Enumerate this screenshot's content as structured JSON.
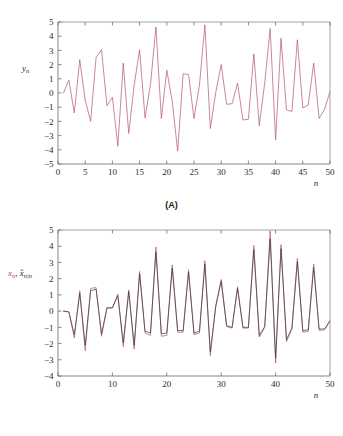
{
  "figure": {
    "background_color": "#ffffff",
    "panel_a_caption": "(A)",
    "panel_b_caption": "(B)"
  },
  "colors": {
    "measurement_red": "#b2556a",
    "estimate_black": "#3a3a3a",
    "label_red": "#c0395a",
    "axis": "#6b6b6b"
  },
  "chart_data": [
    {
      "type": "line",
      "panel": "(A)",
      "title": "",
      "xlabel": "n",
      "ylabel": "y_n",
      "ylabel_parts": {
        "base": "y",
        "sub": "n"
      },
      "xlim": [
        0,
        50
      ],
      "ylim": [
        -5,
        5
      ],
      "xticks": [
        0,
        5,
        10,
        15,
        20,
        25,
        30,
        35,
        40,
        45,
        50
      ],
      "xticklabels": [
        "0",
        "5",
        "10",
        "15",
        "20",
        "25",
        "30",
        "35",
        "40",
        "45",
        "50"
      ],
      "yticks": [
        -5,
        -4,
        -3,
        -2,
        -1,
        0,
        1,
        2,
        3,
        4,
        5
      ],
      "yticklabels": [
        "−5",
        "−4",
        "−3",
        "−2",
        "−1",
        "0",
        "1",
        "2",
        "3",
        "4",
        "5"
      ],
      "grid": false,
      "legend": null,
      "series": [
        {
          "name": "y_n",
          "color": "#b2556a",
          "x": [
            1,
            2,
            3,
            4,
            5,
            6,
            7,
            8,
            9,
            10,
            11,
            12,
            13,
            14,
            15,
            16,
            17,
            18,
            19,
            20,
            21,
            22,
            23,
            24,
            25,
            26,
            27,
            28,
            29,
            30,
            31,
            32,
            33,
            34,
            35,
            36,
            37,
            38,
            39,
            40,
            41,
            42,
            43,
            44,
            45,
            46,
            47,
            48,
            49,
            50
          ],
          "values": [
            0.0,
            0.9,
            -1.4,
            2.35,
            -0.5,
            -2.0,
            2.5,
            3.05,
            -0.9,
            -0.3,
            -3.75,
            2.1,
            -2.85,
            0.55,
            3.05,
            -1.75,
            0.6,
            4.65,
            -1.8,
            1.6,
            -0.6,
            -4.1,
            1.35,
            1.3,
            -1.8,
            0.55,
            4.8,
            -2.5,
            0.05,
            2.0,
            -0.8,
            -0.75,
            0.7,
            -1.9,
            -1.85,
            2.75,
            -2.3,
            0.7,
            4.55,
            -3.3,
            3.85,
            -1.2,
            -1.3,
            3.75,
            -1.05,
            -0.85,
            2.1,
            -1.8,
            -1.15,
            0.1
          ]
        }
      ]
    },
    {
      "type": "line",
      "panel": "(B)",
      "title": "",
      "xlabel": "n",
      "ylabel": "x_n, x̂_n|n",
      "ylabel_parts": {
        "red_base": "x",
        "red_sub": "n",
        "sep": ", ",
        "black_base": "x̂",
        "black_sub": "n|n"
      },
      "xlim": [
        0,
        50
      ],
      "ylim": [
        -4,
        5
      ],
      "xticks": [
        0,
        10,
        20,
        30,
        40,
        50
      ],
      "xticklabels": [
        "0",
        "10",
        "20",
        "30",
        "40",
        "50"
      ],
      "yticks": [
        -4,
        -3,
        -2,
        -1,
        0,
        1,
        2,
        3,
        4,
        5
      ],
      "yticklabels": [
        "−4",
        "−3",
        "−2",
        "−1",
        "0",
        "1",
        "2",
        "3",
        "4",
        "5"
      ],
      "grid": false,
      "legend": null,
      "series": [
        {
          "name": "x_n",
          "color": "#b2556a",
          "x": [
            1,
            2,
            3,
            4,
            5,
            6,
            7,
            8,
            9,
            10,
            11,
            12,
            13,
            14,
            15,
            16,
            17,
            18,
            19,
            20,
            21,
            22,
            23,
            24,
            25,
            26,
            27,
            28,
            29,
            30,
            31,
            32,
            33,
            34,
            35,
            36,
            37,
            38,
            39,
            40,
            41,
            42,
            43,
            44,
            45,
            46,
            47,
            48,
            49,
            50
          ],
          "values": [
            0.0,
            -0.05,
            -1.65,
            1.25,
            -2.45,
            1.4,
            1.45,
            -1.55,
            0.2,
            0.2,
            1.05,
            -2.2,
            1.3,
            -2.35,
            2.45,
            -1.35,
            -1.5,
            3.95,
            -1.55,
            -1.5,
            2.85,
            -1.3,
            -1.3,
            2.55,
            -1.45,
            -1.35,
            3.1,
            -2.75,
            0.3,
            1.95,
            -0.95,
            -1.05,
            1.5,
            -1.05,
            -1.05,
            4.05,
            -1.6,
            -1.0,
            4.95,
            -3.2,
            4.1,
            -1.9,
            -1.1,
            3.25,
            -1.3,
            -1.25,
            2.9,
            -1.2,
            -1.15,
            -0.6
          ]
        },
        {
          "name": "x̂_n|n",
          "color": "#3a3a3a",
          "x": [
            1,
            2,
            3,
            4,
            5,
            6,
            7,
            8,
            9,
            10,
            11,
            12,
            13,
            14,
            15,
            16,
            17,
            18,
            19,
            20,
            21,
            22,
            23,
            24,
            25,
            26,
            27,
            28,
            29,
            30,
            31,
            32,
            33,
            34,
            35,
            36,
            37,
            38,
            39,
            40,
            41,
            42,
            43,
            44,
            45,
            46,
            47,
            48,
            49,
            50
          ],
          "values": [
            0.0,
            -0.05,
            -1.45,
            1.1,
            -2.1,
            1.25,
            1.35,
            -1.4,
            0.2,
            0.2,
            0.95,
            -1.95,
            1.2,
            -2.1,
            2.3,
            -1.25,
            -1.35,
            3.65,
            -1.4,
            -1.35,
            2.65,
            -1.2,
            -1.2,
            2.4,
            -1.35,
            -1.25,
            2.9,
            -2.5,
            0.3,
            1.85,
            -0.9,
            -1.0,
            1.4,
            -1.0,
            -1.0,
            3.8,
            -1.5,
            -0.95,
            4.45,
            -2.9,
            3.85,
            -1.75,
            -1.05,
            3.05,
            -1.2,
            -1.15,
            2.7,
            -1.1,
            -1.1,
            -0.6
          ]
        }
      ]
    }
  ]
}
